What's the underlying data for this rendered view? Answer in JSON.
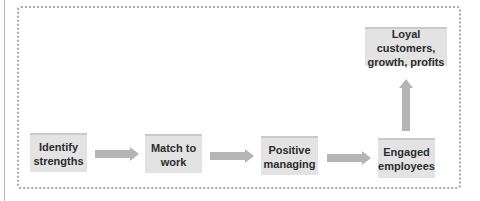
{
  "diagram": {
    "type": "flow",
    "nodes": [
      {
        "id": "identify",
        "label": "Identify strengths",
        "line1": "Identify",
        "line2": "strengths"
      },
      {
        "id": "match",
        "label": "Match to work",
        "line1": "Match to",
        "line2": "work"
      },
      {
        "id": "positive",
        "label": "Positive managing",
        "line1": "Positive",
        "line2": "managing"
      },
      {
        "id": "engaged",
        "label": "Engaged employees",
        "line1": "Engaged",
        "line2": "employees"
      },
      {
        "id": "outcome",
        "label": "Loyal customers, growth, profits",
        "line1": "Loyal customers,",
        "line2": "growth, profits"
      }
    ],
    "edges": [
      {
        "from": "identify",
        "to": "match",
        "direction": "right"
      },
      {
        "from": "match",
        "to": "positive",
        "direction": "right"
      },
      {
        "from": "positive",
        "to": "engaged",
        "direction": "right"
      },
      {
        "from": "engaged",
        "to": "outcome",
        "direction": "up"
      }
    ],
    "colors": {
      "box_fill": "#e3e3e3",
      "box_top_border": "#c9c9c9",
      "arrow": "#b5b5b5",
      "frame_dots": "#a9a9a9",
      "text": "#2c2c2c"
    }
  }
}
